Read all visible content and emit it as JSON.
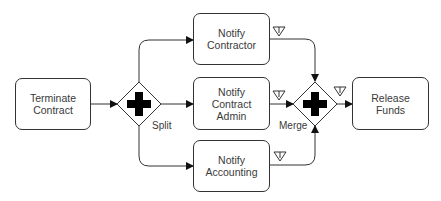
{
  "diagram": {
    "type": "BPMN process",
    "colors": {
      "stroke": "#333333",
      "fill": "#ffffff",
      "text": "#3a3a3a",
      "gateway_marker": "#000000"
    },
    "tasks": [
      {
        "id": "terminate",
        "label": "Terminate Contract",
        "lines": [
          "Terminate",
          "Contract"
        ]
      },
      {
        "id": "notify_contractor",
        "label": "Notify Contractor",
        "lines": [
          "Notify",
          "Contractor"
        ]
      },
      {
        "id": "notify_admin",
        "label": "Notify Contract Admin",
        "lines": [
          "Notify",
          "Contract",
          "Admin"
        ]
      },
      {
        "id": "notify_accounting",
        "label": "Notify Accounting",
        "lines": [
          "Notify",
          "Accounting"
        ]
      },
      {
        "id": "release_funds",
        "label": "Release Funds",
        "lines": [
          "Release",
          "Funds"
        ]
      }
    ],
    "gateways": [
      {
        "id": "split",
        "kind": "parallel",
        "label": "Split",
        "marker": "plus-icon"
      },
      {
        "id": "merge",
        "kind": "parallel",
        "label": "Merge",
        "marker": "plus-icon"
      }
    ],
    "flows": [
      {
        "from": "terminate",
        "to": "split"
      },
      {
        "from": "split",
        "to": "notify_contractor"
      },
      {
        "from": "split",
        "to": "notify_admin"
      },
      {
        "from": "split",
        "to": "notify_accounting"
      },
      {
        "from": "notify_contractor",
        "to": "merge",
        "marker": "data-triangle-icon"
      },
      {
        "from": "notify_admin",
        "to": "merge",
        "marker": "data-triangle-icon"
      },
      {
        "from": "notify_accounting",
        "to": "merge",
        "marker": "data-triangle-icon"
      },
      {
        "from": "merge",
        "to": "release_funds",
        "marker": "data-triangle-icon"
      }
    ]
  }
}
